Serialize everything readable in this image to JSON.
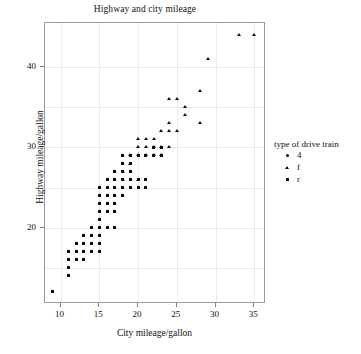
{
  "chart_data": {
    "type": "scatter",
    "title": "Highway and city mileage",
    "xlabel": "City mileage/gallon",
    "ylabel": "Highway mileage/gallon",
    "xlim": [
      8,
      36.5
    ],
    "ylim": [
      10.5,
      45.5
    ],
    "xticks": [
      10,
      15,
      20,
      25,
      30,
      35
    ],
    "yticks": [
      20,
      30,
      40
    ],
    "grid": true,
    "legend": {
      "title": "type of drive train",
      "position": "right",
      "entries": [
        {
          "label": "4",
          "marker": "circle"
        },
        {
          "label": "f",
          "marker": "triangle"
        },
        {
          "label": "r",
          "marker": "square"
        }
      ]
    },
    "series": [
      {
        "name": "4",
        "marker": "square",
        "points": [
          [
            9,
            12
          ],
          [
            11,
            14
          ],
          [
            11,
            15
          ],
          [
            11,
            16
          ],
          [
            11,
            17
          ],
          [
            12,
            16
          ],
          [
            12,
            17
          ],
          [
            12,
            18
          ],
          [
            13,
            16
          ],
          [
            13,
            17
          ],
          [
            13,
            18
          ],
          [
            13,
            19
          ],
          [
            14,
            17
          ],
          [
            14,
            18
          ],
          [
            14,
            19
          ],
          [
            14,
            20
          ],
          [
            15,
            17
          ],
          [
            15,
            18
          ],
          [
            15,
            19
          ],
          [
            15,
            20
          ],
          [
            15,
            21
          ],
          [
            15,
            22
          ],
          [
            15,
            23
          ],
          [
            15,
            24
          ],
          [
            15,
            25
          ],
          [
            16,
            20
          ],
          [
            16,
            22
          ],
          [
            16,
            23
          ],
          [
            16,
            24
          ],
          [
            16,
            25
          ],
          [
            16,
            26
          ],
          [
            17,
            20
          ],
          [
            17,
            22
          ],
          [
            17,
            23
          ],
          [
            17,
            24
          ],
          [
            17,
            25
          ],
          [
            17,
            26
          ],
          [
            17,
            27
          ],
          [
            18,
            24
          ],
          [
            18,
            25
          ],
          [
            18,
            26
          ],
          [
            18,
            27
          ],
          [
            18,
            28
          ],
          [
            18,
            29
          ],
          [
            19,
            25
          ],
          [
            19,
            26
          ],
          [
            19,
            27
          ],
          [
            19,
            28
          ],
          [
            19,
            29
          ],
          [
            20,
            25
          ],
          [
            20,
            26
          ],
          [
            20,
            29
          ],
          [
            21,
            25
          ],
          [
            21,
            26
          ],
          [
            21,
            29
          ],
          [
            22,
            29
          ],
          [
            22,
            30
          ],
          [
            23,
            29
          ],
          [
            23,
            30
          ]
        ]
      },
      {
        "name": "f",
        "marker": "triangle",
        "points": [
          [
            18,
            26
          ],
          [
            18,
            27
          ],
          [
            19,
            28
          ],
          [
            19,
            29
          ],
          [
            20,
            26
          ],
          [
            20,
            29
          ],
          [
            20,
            30
          ],
          [
            20,
            31
          ],
          [
            21,
            29
          ],
          [
            21,
            30
          ],
          [
            21,
            31
          ],
          [
            22,
            29
          ],
          [
            22,
            30
          ],
          [
            22,
            31
          ],
          [
            23,
            29
          ],
          [
            23,
            30
          ],
          [
            23,
            32
          ],
          [
            24,
            30
          ],
          [
            24,
            32
          ],
          [
            24,
            33
          ],
          [
            24,
            36
          ],
          [
            25,
            32
          ],
          [
            25,
            36
          ],
          [
            26,
            34
          ],
          [
            26,
            35
          ],
          [
            28,
            33
          ],
          [
            28,
            37
          ],
          [
            29,
            41
          ],
          [
            33,
            44
          ],
          [
            35,
            44
          ]
        ]
      },
      {
        "name": "r",
        "marker": "square",
        "points": [
          [
            11,
            17
          ],
          [
            12,
            17
          ],
          [
            13,
            17
          ],
          [
            14,
            17
          ],
          [
            15,
            17
          ],
          [
            12,
            18
          ],
          [
            13,
            18
          ],
          [
            14,
            18
          ],
          [
            15,
            24
          ],
          [
            16,
            25
          ],
          [
            17,
            25
          ],
          [
            16,
            26
          ],
          [
            17,
            26
          ]
        ]
      }
    ]
  }
}
